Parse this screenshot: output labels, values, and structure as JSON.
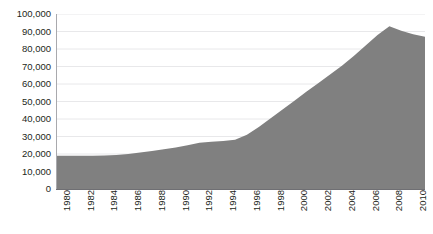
{
  "title": {
    "text": "",
    "visible": false,
    "note": "cropped"
  },
  "colors": {
    "area_fill": "#808080",
    "background": "#ffffff",
    "axis": "#6f6f73",
    "gridline": "#e8e8ea",
    "text": "#231f20"
  },
  "chart_data": {
    "type": "area",
    "title": "",
    "xlabel": "",
    "ylabel": "",
    "ylim": [
      0,
      100000
    ],
    "xlim": [
      1980,
      2011
    ],
    "grid": true,
    "legend": "none",
    "y_ticks": [
      "0",
      "10,000",
      "20,000",
      "30,000",
      "40,000",
      "50,000",
      "60,000",
      "70,000",
      "80,000",
      "90,000",
      "100,000"
    ],
    "y_tick_values": [
      0,
      10000,
      20000,
      30000,
      40000,
      50000,
      60000,
      70000,
      80000,
      90000,
      100000
    ],
    "x_tick_labels": [
      "1980",
      "1982",
      "1984",
      "1986",
      "1988",
      "1990",
      "1992",
      "1994",
      "1996",
      "1998",
      "2000",
      "2002",
      "2004",
      "2006",
      "2008",
      "2010"
    ],
    "x_tick_values": [
      1980,
      1982,
      1984,
      1986,
      1988,
      1990,
      1992,
      1994,
      1996,
      1998,
      2000,
      2002,
      2004,
      2006,
      2008,
      2010
    ],
    "series": [
      {
        "name": "series-1",
        "fill": "#808080",
        "x": [
          1980,
          1981,
          1982,
          1983,
          1984,
          1985,
          1986,
          1987,
          1988,
          1989,
          1990,
          1991,
          1992,
          1993,
          1994,
          1995,
          1996,
          1997,
          1998,
          1999,
          2000,
          2001,
          2002,
          2003,
          2004,
          2005,
          2006,
          2007,
          2008,
          2009,
          2010,
          2011
        ],
        "values": [
          19000,
          19000,
          19000,
          19000,
          19200,
          19400,
          20000,
          20800,
          21700,
          22700,
          23700,
          25000,
          26400,
          27000,
          27500,
          28200,
          31000,
          35500,
          40500,
          45500,
          50500,
          55500,
          60500,
          65500,
          70500,
          76000,
          82000,
          88000,
          93000,
          90500,
          88500,
          87000
        ]
      }
    ]
  }
}
